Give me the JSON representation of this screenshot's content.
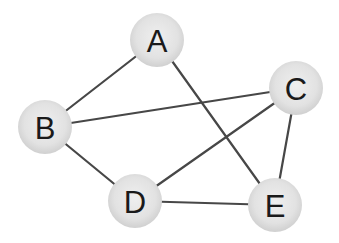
{
  "diagram": {
    "type": "undirected-graph",
    "colors": {
      "edge": "#474747",
      "node_fill_center": "#eeeeee",
      "node_fill_edge": "#d2d2d2",
      "label": "#1a1a1a",
      "background": "#ffffff"
    },
    "node_radius": 27,
    "nodes": [
      {
        "id": "A",
        "label": "A",
        "x": 157,
        "y": 40
      },
      {
        "id": "B",
        "label": "B",
        "x": 45,
        "y": 127
      },
      {
        "id": "C",
        "label": "C",
        "x": 296,
        "y": 88
      },
      {
        "id": "D",
        "label": "D",
        "x": 135,
        "y": 201
      },
      {
        "id": "E",
        "label": "E",
        "x": 275,
        "y": 205
      }
    ],
    "edges": [
      {
        "from": "A",
        "to": "B"
      },
      {
        "from": "A",
        "to": "E"
      },
      {
        "from": "B",
        "to": "C"
      },
      {
        "from": "B",
        "to": "D"
      },
      {
        "from": "C",
        "to": "D"
      },
      {
        "from": "C",
        "to": "E"
      },
      {
        "from": "D",
        "to": "E"
      }
    ]
  }
}
